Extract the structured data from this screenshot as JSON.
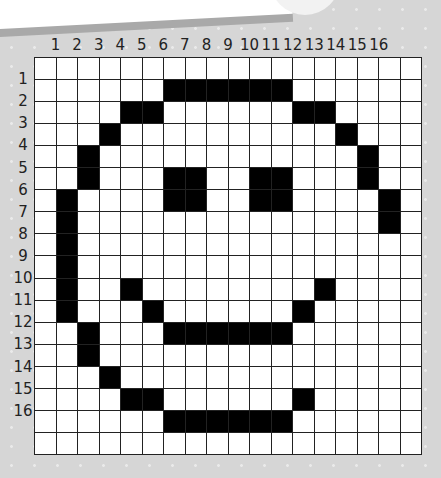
{
  "puzzle": {
    "column_labels": [
      "1",
      "2",
      "3",
      "4",
      "5",
      "6",
      "7",
      "8",
      "9",
      "10",
      "11",
      "12",
      "13",
      "14",
      "15",
      "16"
    ],
    "row_labels": [
      "1",
      "2",
      "3",
      "4",
      "5",
      "6",
      "7",
      "8",
      "9",
      "10",
      "11",
      "12",
      "13",
      "14",
      "15",
      "16"
    ],
    "grid_size": 18,
    "filled_cells": [
      [
        1,
        6
      ],
      [
        1,
        7
      ],
      [
        1,
        8
      ],
      [
        1,
        9
      ],
      [
        1,
        10
      ],
      [
        1,
        11
      ],
      [
        2,
        4
      ],
      [
        2,
        5
      ],
      [
        2,
        12
      ],
      [
        2,
        13
      ],
      [
        3,
        3
      ],
      [
        3,
        14
      ],
      [
        4,
        2
      ],
      [
        4,
        15
      ],
      [
        5,
        2
      ],
      [
        5,
        6
      ],
      [
        5,
        7
      ],
      [
        5,
        10
      ],
      [
        5,
        11
      ],
      [
        5,
        15
      ],
      [
        6,
        1
      ],
      [
        6,
        6
      ],
      [
        6,
        7
      ],
      [
        6,
        10
      ],
      [
        6,
        11
      ],
      [
        6,
        16
      ],
      [
        7,
        1
      ],
      [
        7,
        16
      ],
      [
        8,
        1
      ],
      [
        9,
        1
      ],
      [
        10,
        1
      ],
      [
        10,
        4
      ],
      [
        10,
        13
      ],
      [
        11,
        1
      ],
      [
        11,
        5
      ],
      [
        11,
        12
      ],
      [
        12,
        2
      ],
      [
        12,
        6
      ],
      [
        12,
        7
      ],
      [
        12,
        8
      ],
      [
        12,
        9
      ],
      [
        12,
        10
      ],
      [
        12,
        11
      ],
      [
        13,
        2
      ],
      [
        14,
        3
      ],
      [
        15,
        4
      ],
      [
        15,
        5
      ],
      [
        15,
        12
      ],
      [
        16,
        6
      ],
      [
        16,
        7
      ],
      [
        16,
        8
      ],
      [
        16,
        9
      ],
      [
        16,
        10
      ],
      [
        16,
        11
      ]
    ],
    "fill_color": "#000000",
    "empty_color": "#ffffff",
    "picture": "smiley-face"
  }
}
